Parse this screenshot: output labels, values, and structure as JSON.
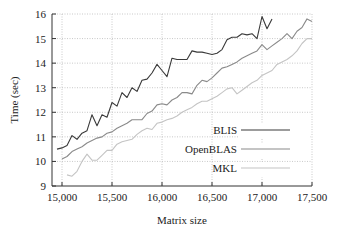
{
  "chart_data": {
    "type": "line",
    "title": "",
    "xlabel": "Matrix size",
    "ylabel": "Time (sec)",
    "xlim": [
      15000,
      17500
    ],
    "ylim": [
      9,
      16
    ],
    "xticks": [
      15000,
      15500,
      16000,
      16500,
      17000,
      17500
    ],
    "xtick_labels": [
      "15,000",
      "15,500",
      "16,000",
      "16,500",
      "17,000",
      "17,500"
    ],
    "yticks": [
      9,
      10,
      11,
      12,
      13,
      14,
      15,
      16
    ],
    "ytick_labels": [
      "9",
      "10",
      "11",
      "12",
      "13",
      "14",
      "15",
      "16"
    ],
    "grid": true,
    "legend_position": "lower right",
    "series": [
      {
        "name": "BLIS",
        "color": "#3a3a3a",
        "x": [
          14950,
          15000,
          15050,
          15100,
          15150,
          15200,
          15250,
          15300,
          15350,
          15400,
          15450,
          15500,
          15550,
          15600,
          15650,
          15700,
          15750,
          15800,
          15850,
          15900,
          15950,
          16000,
          16050,
          16100,
          16150,
          16200,
          16250,
          16300,
          16350,
          16400,
          16450,
          16500,
          16550,
          16600,
          16650,
          16700,
          16750,
          16800,
          16850,
          16900,
          16950,
          17000,
          17050,
          17100
        ],
        "y": [
          10.5,
          10.55,
          10.65,
          11.05,
          10.9,
          11.15,
          11.25,
          11.9,
          11.45,
          11.9,
          11.8,
          12.4,
          12.25,
          12.8,
          12.6,
          13.0,
          12.85,
          13.3,
          13.35,
          13.6,
          13.95,
          13.7,
          13.45,
          14.2,
          14.15,
          14.15,
          14.15,
          14.5,
          14.45,
          14.45,
          14.4,
          14.35,
          14.4,
          14.55,
          14.95,
          15.05,
          15.05,
          15.2,
          15.15,
          15.2,
          15.0,
          15.9,
          15.4,
          15.8
        ]
      },
      {
        "name": "OpenBLAS",
        "color": "#8a8a8a",
        "x": [
          15000,
          15050,
          15100,
          15150,
          15200,
          15250,
          15300,
          15350,
          15400,
          15450,
          15500,
          15550,
          15600,
          15650,
          15700,
          15750,
          15800,
          15850,
          15900,
          15950,
          16000,
          16050,
          16100,
          16150,
          16200,
          16250,
          16300,
          16350,
          16400,
          16450,
          16500,
          16550,
          16600,
          16650,
          16700,
          16750,
          16800,
          16850,
          16900,
          16950,
          17000,
          17050,
          17100,
          17150,
          17200,
          17250,
          17300,
          17350,
          17400,
          17450,
          17500
        ],
        "y": [
          10.1,
          10.2,
          10.4,
          10.5,
          10.6,
          10.75,
          10.85,
          10.95,
          11.0,
          11.15,
          11.2,
          11.35,
          11.45,
          11.55,
          11.7,
          11.7,
          11.7,
          11.95,
          12.05,
          12.3,
          12.35,
          12.3,
          12.5,
          12.6,
          12.8,
          12.8,
          12.75,
          13.1,
          13.3,
          13.25,
          13.4,
          13.6,
          13.8,
          13.85,
          13.95,
          14.05,
          14.2,
          14.3,
          14.4,
          14.5,
          14.75,
          14.55,
          14.7,
          14.85,
          15.0,
          15.2,
          15.0,
          15.3,
          15.45,
          15.8,
          15.7
        ]
      },
      {
        "name": "MKL",
        "color": "#c4c4c4",
        "x": [
          15050,
          15100,
          15150,
          15200,
          15250,
          15300,
          15350,
          15400,
          15450,
          15500,
          15550,
          15600,
          15650,
          15700,
          15750,
          15800,
          15850,
          15900,
          15950,
          16000,
          16050,
          16100,
          16150,
          16200,
          16250,
          16300,
          16350,
          16400,
          16450,
          16500,
          16550,
          16600,
          16650,
          16700,
          16750,
          16800,
          16850,
          16900,
          16950,
          17000,
          17050,
          17100,
          17150,
          17200,
          17250,
          17300,
          17350,
          17400,
          17450,
          17500
        ],
        "y": [
          9.45,
          9.4,
          9.6,
          10.0,
          10.3,
          10.05,
          10.05,
          10.25,
          10.45,
          10.45,
          10.7,
          10.8,
          10.85,
          10.9,
          11.1,
          11.25,
          11.35,
          11.3,
          11.55,
          11.6,
          11.7,
          11.75,
          11.85,
          12.0,
          12.1,
          12.2,
          12.35,
          12.45,
          12.45,
          12.55,
          12.65,
          12.8,
          12.95,
          13.0,
          12.75,
          12.9,
          13.05,
          13.2,
          13.3,
          13.5,
          13.6,
          13.7,
          13.95,
          14.05,
          14.15,
          14.3,
          14.5,
          14.8,
          15.0,
          15.0
        ]
      }
    ]
  }
}
